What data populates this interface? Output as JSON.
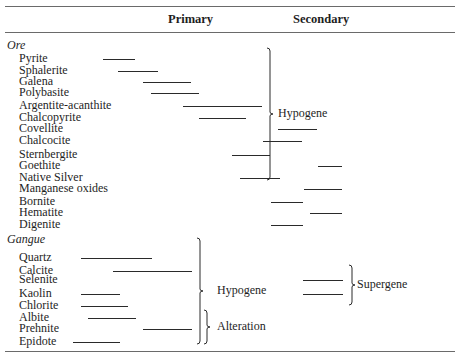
{
  "header": {
    "primary_label": "Primary",
    "secondary_label": "Secondary"
  },
  "sections": {
    "ore": {
      "title": "Ore",
      "minerals": [
        {
          "name": "Pyrite",
          "y": 59,
          "bars": [
            [
              103,
              135
            ]
          ]
        },
        {
          "name": "Sphalerite",
          "y": 71,
          "bars": [
            [
              118,
              158
            ]
          ]
        },
        {
          "name": "Galena",
          "y": 82,
          "bars": [
            [
              143,
              191
            ]
          ]
        },
        {
          "name": "Polybasite",
          "y": 93,
          "bars": [
            [
              151,
              199
            ]
          ]
        },
        {
          "name": "Argentite-acanthite",
          "y": 106,
          "bars": [
            [
              183,
              262
            ]
          ]
        },
        {
          "name": "Chalcopyrite",
          "y": 118,
          "bars": [
            [
              199,
              246
            ]
          ]
        },
        {
          "name": "Covellite",
          "y": 129,
          "bars": [
            [
              278,
              317
            ]
          ]
        },
        {
          "name": "Chalcocite",
          "y": 141,
          "bars": [
            [
              263,
              302
            ]
          ]
        },
        {
          "name": "Sternbergite",
          "y": 155,
          "bars": [
            [
              232,
              270
            ]
          ]
        },
        {
          "name": "Goethite",
          "y": 166,
          "bars": [
            [
              318,
              342
            ]
          ]
        },
        {
          "name": "Native Silver",
          "y": 178,
          "bars": [
            [
              240,
              280
            ]
          ]
        },
        {
          "name": "Manganese oxides",
          "y": 189,
          "bars": [
            [
              304,
              342
            ]
          ]
        },
        {
          "name": "Bornite",
          "y": 202,
          "bars": [
            [
              271,
              303
            ]
          ]
        },
        {
          "name": "Hematite",
          "y": 213,
          "bars": [
            [
              310,
              342
            ]
          ]
        },
        {
          "name": "Digenite",
          "y": 225,
          "bars": [
            [
              271,
              303
            ]
          ]
        }
      ],
      "brackets": [
        {
          "label": "Hypogene",
          "x": 270,
          "y1": 48,
          "y2": 180,
          "label_x": 278
        }
      ]
    },
    "gangue": {
      "title": "Gangue",
      "minerals": [
        {
          "name": "Quartz",
          "y": 258,
          "bars": [
            [
              81,
              152
            ]
          ]
        },
        {
          "name": "Calcite",
          "y": 271,
          "bars": [
            [
              113,
              192
            ]
          ]
        },
        {
          "name": "Selenite",
          "y": 280,
          "bars": [
            [
              303,
              343
            ]
          ]
        },
        {
          "name": "Kaolin",
          "y": 294,
          "bars": [
            [
              81,
              120
            ],
            [
              303,
              343
            ]
          ]
        },
        {
          "name": "Chlorite",
          "y": 306,
          "bars": [
            [
              81,
              128
            ]
          ]
        },
        {
          "name": "Albite",
          "y": 318,
          "bars": [
            [
              88,
              136
            ]
          ]
        },
        {
          "name": "Prehnite",
          "y": 329,
          "bars": [
            [
              143,
              192
            ]
          ]
        },
        {
          "name": "Epidote",
          "y": 342,
          "bars": [
            [
              73,
              120
            ]
          ]
        }
      ],
      "brackets": [
        {
          "label": "Hypogene",
          "x": 200,
          "y1": 238,
          "y2": 344,
          "label_x": 217
        },
        {
          "label": "Alteration",
          "x": 207,
          "y1": 310,
          "y2": 344,
          "label_x": 217
        },
        {
          "label": "Supergene",
          "x": 352,
          "y1": 265,
          "y2": 305,
          "label_x": 357
        }
      ]
    }
  },
  "layout": {
    "rules_y": [
      6,
      32,
      351
    ],
    "ore_title_y": 40,
    "gangue_title_y": 233,
    "mineral_first_y": {
      "ore": 53,
      "gangue": 252
    },
    "primary_x": 168,
    "secondary_x": 293
  }
}
